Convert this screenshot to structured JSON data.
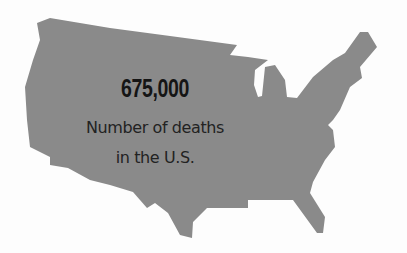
{
  "map": {
    "region": "United States",
    "fill_color": "#8a8a8a"
  },
  "stat": {
    "value": "675,000",
    "label_line1": "Number of deaths",
    "label_line2": "in the U.S."
  }
}
